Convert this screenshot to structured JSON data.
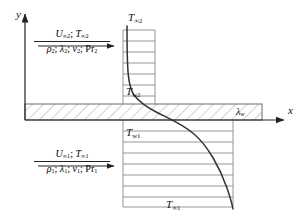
{
  "figure": {
    "type": "conjugate-heat-transfer-schematic",
    "background": "#ffffff",
    "line_color": "#222222",
    "profile_color": "#8a8a8a",
    "curve_color": "#333333",
    "hatch_color": "#9a9a9a"
  },
  "axes": {
    "x_label": "x",
    "y_label": "y",
    "x_axis": {
      "y": 120,
      "x_start": 25,
      "x_end": 286
    },
    "y_axis": {
      "x": 25,
      "y_start": 12,
      "y_end": 120
    }
  },
  "wall": {
    "name": "conducting-wall",
    "conductivity_label": "λ",
    "conductivity_sub": "w",
    "x_start": 25,
    "x_end": 262,
    "y_top": 104,
    "y_bottom": 120
  },
  "upper_stream": {
    "name": "stream-2",
    "velocity": "U",
    "velocity_sub": "∞2",
    "temperature": "T",
    "temperature_sub": "∞2",
    "density": "ρ",
    "density_sub": "2",
    "conductivity": "λ",
    "conductivity_sub": "2",
    "viscosity": "ν",
    "viscosity_sub": "2",
    "prandtl": "Pr",
    "prandtl_sub": "2",
    "arrow_direction": "right"
  },
  "lower_stream": {
    "name": "stream-1",
    "velocity": "U",
    "velocity_sub": "∞1",
    "temperature": "T",
    "temperature_sub": "∞1",
    "density": "ρ",
    "density_sub": "1",
    "conductivity": "λ",
    "conductivity_sub": "1",
    "viscosity": "ν",
    "viscosity_sub": "1",
    "prandtl": "Pr",
    "prandtl_sub": "1",
    "arrow_direction": "right"
  },
  "temperature_labels": {
    "free_stream_upper": {
      "base": "T",
      "sub": "∞2"
    },
    "wall_upper": {
      "base": "T",
      "sub": "w2"
    },
    "wall_lower": {
      "base": "T",
      "sub": "w1"
    },
    "free_stream_lower": {
      "base": "T",
      "sub": "∞1"
    }
  },
  "upper_profile": {
    "name": "upper-boundary-layer-profile",
    "left_rail_x": 123,
    "right_rail_x": 155,
    "top_y": 30,
    "bottom_y": 104,
    "rung_count": 7,
    "rung_ys": [
      30,
      41,
      52,
      63,
      74,
      85,
      96,
      104
    ]
  },
  "lower_profile": {
    "name": "lower-boundary-layer-profile",
    "left_rail_x": 123,
    "right_rail_x": 233,
    "top_y": 120,
    "bottom_y": 207,
    "rung_count": 8,
    "rung_ys": [
      120,
      131,
      142,
      153,
      164,
      175,
      186,
      197,
      207
    ]
  },
  "temperature_curve": {
    "name": "temperature-distribution-curve",
    "shape": "s-curve",
    "upper_asymptote_x": 127,
    "lower_asymptote_x": 233,
    "crosses_wall": true
  }
}
